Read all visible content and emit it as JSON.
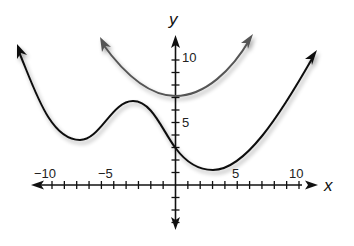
{
  "chart_data": {
    "type": "line",
    "title": "",
    "xlabel": "x",
    "ylabel": "y",
    "xlim": [
      -12,
      10.5
    ],
    "ylim": [
      -3.5,
      12
    ],
    "grid": false,
    "legend": null,
    "x_tick_labels": [
      "−10",
      "−5",
      "5",
      "10"
    ],
    "x_tick_label_values": [
      -10,
      -5,
      5,
      10
    ],
    "y_tick_labels": [
      "5",
      "10"
    ],
    "y_tick_label_values": [
      5,
      10
    ],
    "x_minor_ticks": [
      -10,
      -9,
      -8,
      -7,
      -6,
      -5,
      -4,
      -3,
      -2,
      -1,
      1,
      2,
      3,
      4,
      5,
      6,
      7,
      8,
      9,
      10
    ],
    "y_minor_ticks": [
      -3,
      -2,
      -1,
      1,
      2,
      3,
      4,
      5,
      6,
      7,
      8,
      9,
      10
    ],
    "series": [
      {
        "name": "black curve",
        "color": "#111111",
        "arrows_at_ends": true,
        "points": [
          {
            "x": -12.8,
            "y": 11.0
          },
          {
            "x": -10.0,
            "y": 5.8
          },
          {
            "x": -7.7,
            "y": 3.6
          },
          {
            "x": -5.5,
            "y": 5.2
          },
          {
            "x": -3.4,
            "y": 6.7
          },
          {
            "x": -1.5,
            "y": 5.5
          },
          {
            "x": 0,
            "y": 3.0
          },
          {
            "x": 3.0,
            "y": 1.2
          },
          {
            "x": 6.0,
            "y": 3.6
          },
          {
            "x": 9.0,
            "y": 7.5
          },
          {
            "x": 11.4,
            "y": 10.6
          }
        ],
        "key_points": {
          "local_min_left": {
            "x": -7.7,
            "y": 3.6
          },
          "local_max": {
            "x": -3.4,
            "y": 6.7
          },
          "y_intercept": {
            "x": 0,
            "y": 3.0
          },
          "global_min": {
            "x": 3.0,
            "y": 1.2
          }
        }
      },
      {
        "name": "gray curve",
        "color": "#555555",
        "arrows_at_ends": true,
        "points": [
          {
            "x": -6.1,
            "y": 11.6
          },
          {
            "x": -3.0,
            "y": 8.5
          },
          {
            "x": 0,
            "y": 7.1
          },
          {
            "x": 3.0,
            "y": 8.6
          },
          {
            "x": 6.2,
            "y": 11.9
          }
        ],
        "key_points": {
          "vertex": {
            "x": 0,
            "y": 7.1
          }
        }
      }
    ]
  },
  "labels": {
    "x_axis": "x",
    "y_axis": "y",
    "x_neg10": "−10",
    "x_neg5": "−5",
    "x_5": "5",
    "x_10": "10",
    "y_5": "5",
    "y_10": "10"
  }
}
